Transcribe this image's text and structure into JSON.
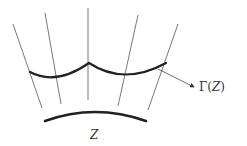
{
  "diagram": {
    "labels": {
      "gamma_prefix": "Γ(",
      "gamma_z": "Z",
      "gamma_suffix": ")",
      "base_curve": "Z"
    },
    "colors": {
      "thin_line": "#555555",
      "thick_curve": "#222222",
      "text": "#333333"
    },
    "rays": [
      {
        "x1": 13,
        "y1": 24,
        "x2": 42,
        "y2": 108
      },
      {
        "x1": 45,
        "y1": 13,
        "x2": 61,
        "y2": 104
      },
      {
        "x1": 88,
        "y1": 8,
        "x2": 88,
        "y2": 100
      },
      {
        "x1": 138,
        "y1": 15,
        "x2": 118,
        "y2": 106
      },
      {
        "x1": 178,
        "y1": 24,
        "x2": 148,
        "y2": 110
      }
    ],
    "curves": {
      "gamma_curve": "M30,72 Q56,86 89,63 Q124,86 166,63",
      "base_arc": "M45,121 Q95,103 146,121"
    },
    "arrow": {
      "x1": 158,
      "y1": 69,
      "x2": 194,
      "y2": 87
    }
  }
}
